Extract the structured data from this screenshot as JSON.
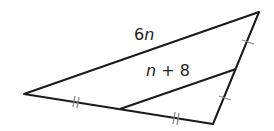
{
  "figure": {
    "type": "triangle with midsegment",
    "labels": {
      "long_side": "6n",
      "midsegment": "n + 8"
    },
    "label_parts": {
      "long_coef": "6",
      "long_var": "n",
      "mid_var": "n",
      "mid_rest": " + 8"
    },
    "tick_marks": {
      "bottom_side": "double",
      "right_side": "single"
    },
    "colors": {
      "line": "#1a1a1a",
      "tick": "#888888"
    }
  }
}
